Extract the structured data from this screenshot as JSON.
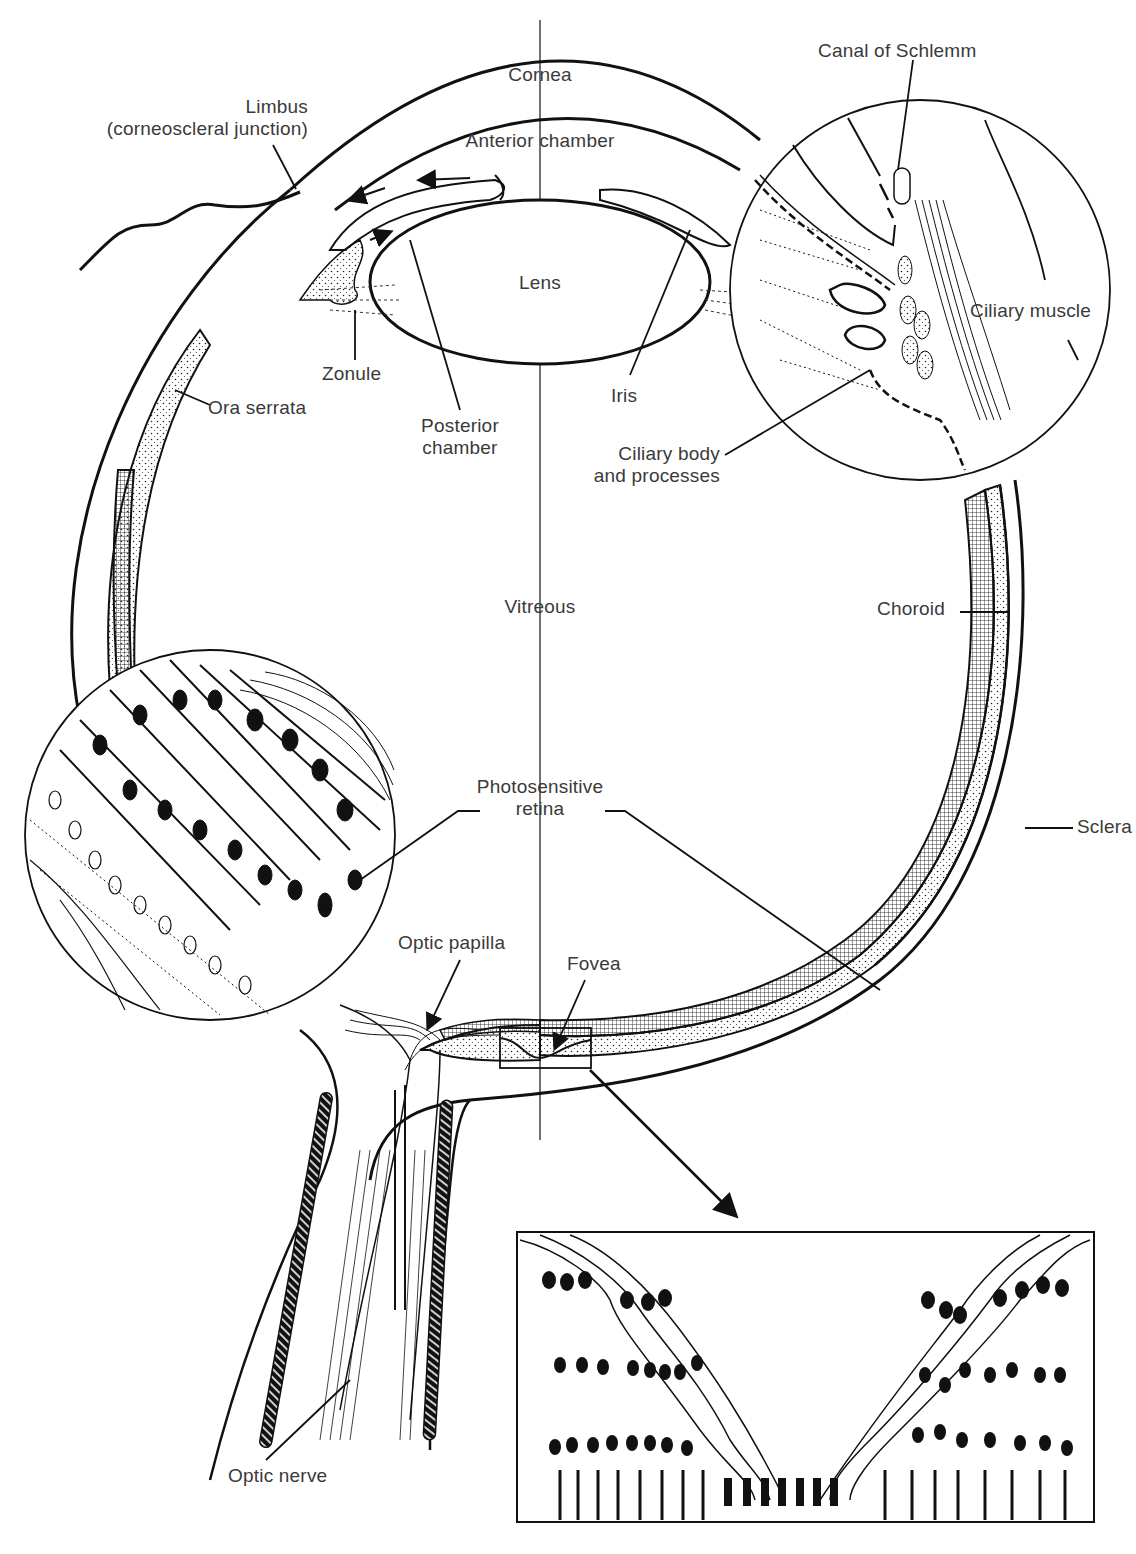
{
  "diagram": {
    "ink_color": "#111111",
    "label_color": "#3a3a3a",
    "background": "#ffffff"
  },
  "labels": {
    "cornea": "Cornea",
    "limbus_line1": "Limbus",
    "limbus_line2": "(corneoscleral junction)",
    "anterior_chamber": "Anterior chamber",
    "canal_of_schlemm": "Canal of Schlemm",
    "lens": "Lens",
    "ciliary_muscle": "Ciliary muscle",
    "zonule": "Zonule",
    "iris": "Iris",
    "ora_serrata": "Ora serrata",
    "posterior_chamber_line1": "Posterior",
    "posterior_chamber_line2": "chamber",
    "ciliary_body_line1": "Ciliary body",
    "ciliary_body_line2": "and processes",
    "vitreous": "Vitreous",
    "choroid": "Choroid",
    "photosensitive_retina_line1": "Photosensitive",
    "photosensitive_retina_line2": "retina",
    "sclera": "Sclera",
    "optic_papilla": "Optic papilla",
    "fovea": "Fovea",
    "optic_nerve": "Optic nerve"
  },
  "insets": [
    {
      "name": "ciliary-region-magnified",
      "shape": "circle"
    },
    {
      "name": "retina-layers-magnified",
      "shape": "circle"
    },
    {
      "name": "fovea-magnified",
      "shape": "rectangle"
    }
  ]
}
